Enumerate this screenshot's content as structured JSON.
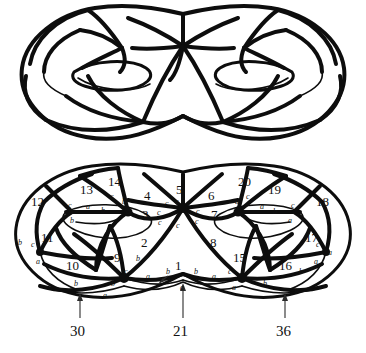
{
  "figure": {
    "top_panel": {
      "name": "double-torus-embedding",
      "description": "Double torus (genus 2 surface) with a graph drawn on it"
    },
    "bottom_panel": {
      "name": "planar-labelled-diagram",
      "description": "Planar projection of the double torus with numbered faces and lettered edges"
    }
  },
  "regions": [
    {
      "label": "1",
      "x": 179,
      "y": 266
    },
    {
      "label": "2",
      "x": 145,
      "y": 243
    },
    {
      "label": "3",
      "x": 146,
      "y": 215
    },
    {
      "label": "4",
      "x": 148,
      "y": 196
    },
    {
      "label": "5",
      "x": 180,
      "y": 190
    },
    {
      "label": "6",
      "x": 212,
      "y": 196
    },
    {
      "label": "7",
      "x": 215,
      "y": 215
    },
    {
      "label": "8",
      "x": 214,
      "y": 243
    },
    {
      "label": "9",
      "x": 118,
      "y": 258
    },
    {
      "label": "10",
      "x": 74,
      "y": 266
    },
    {
      "label": "11",
      "x": 49,
      "y": 238
    },
    {
      "label": "12",
      "x": 39,
      "y": 202
    },
    {
      "label": "13",
      "x": 88,
      "y": 190
    },
    {
      "label": "14",
      "x": 116,
      "y": 182
    },
    {
      "label": "15",
      "x": 241,
      "y": 258
    },
    {
      "label": "16",
      "x": 287,
      "y": 266
    },
    {
      "label": "17",
      "x": 313,
      "y": 238
    },
    {
      "label": "18",
      "x": 324,
      "y": 202
    },
    {
      "label": "19",
      "x": 276,
      "y": 190
    },
    {
      "label": "20",
      "x": 246,
      "y": 182
    }
  ],
  "edge_letters": [
    {
      "label": "c",
      "x": 177,
      "y": 202
    },
    {
      "label": "c",
      "x": 167,
      "y": 204
    },
    {
      "label": "c",
      "x": 189,
      "y": 204
    },
    {
      "label": "c",
      "x": 159,
      "y": 213
    },
    {
      "label": "c",
      "x": 198,
      "y": 212
    },
    {
      "label": "c",
      "x": 160,
      "y": 223
    },
    {
      "label": "c",
      "x": 197,
      "y": 222
    },
    {
      "label": "c",
      "x": 178,
      "y": 226
    },
    {
      "label": "c",
      "x": 112,
      "y": 197
    },
    {
      "label": "b",
      "x": 124,
      "y": 202
    },
    {
      "label": "b",
      "x": 103,
      "y": 211
    },
    {
      "label": "a",
      "x": 128,
      "y": 212
    },
    {
      "label": "a",
      "x": 88,
      "y": 207
    },
    {
      "label": "c",
      "x": 70,
      "y": 206
    },
    {
      "label": "b",
      "x": 72,
      "y": 221
    },
    {
      "label": "c",
      "x": 248,
      "y": 197
    },
    {
      "label": "a",
      "x": 237,
      "y": 202
    },
    {
      "label": "b",
      "x": 275,
      "y": 212
    },
    {
      "label": "a",
      "x": 248,
      "y": 212
    },
    {
      "label": "a",
      "x": 262,
      "y": 207
    },
    {
      "label": "c",
      "x": 293,
      "y": 206
    },
    {
      "label": "a",
      "x": 290,
      "y": 221
    },
    {
      "label": "b",
      "x": 20,
      "y": 243
    },
    {
      "label": "c",
      "x": 33,
      "y": 245
    },
    {
      "label": "a",
      "x": 38,
      "y": 262
    },
    {
      "label": "b",
      "x": 76,
      "y": 284
    },
    {
      "label": "a",
      "x": 105,
      "y": 296
    },
    {
      "label": "c",
      "x": 126,
      "y": 272
    },
    {
      "label": "b",
      "x": 138,
      "y": 259
    },
    {
      "label": "b",
      "x": 113,
      "y": 284
    },
    {
      "label": "a",
      "x": 148,
      "y": 277
    },
    {
      "label": "b",
      "x": 168,
      "y": 272
    },
    {
      "label": "b",
      "x": 196,
      "y": 272
    },
    {
      "label": "a",
      "x": 214,
      "y": 277
    },
    {
      "label": "c",
      "x": 230,
      "y": 272
    },
    {
      "label": "a",
      "x": 234,
      "y": 288
    },
    {
      "label": "a",
      "x": 182,
      "y": 288
    },
    {
      "label": "b",
      "x": 265,
      "y": 284
    },
    {
      "label": "a",
      "x": 316,
      "y": 262
    },
    {
      "label": "c",
      "x": 318,
      "y": 245
    },
    {
      "label": "b",
      "x": 301,
      "y": 272
    },
    {
      "label": "a",
      "x": 330,
      "y": 253
    },
    {
      "label": "a",
      "x": 297,
      "y": 290
    }
  ],
  "boundary_labels": [
    {
      "label": "30",
      "x": 80,
      "y": 332
    },
    {
      "label": "21",
      "x": 180,
      "y": 332
    },
    {
      "label": "36",
      "x": 285,
      "y": 332
    }
  ],
  "colors": {
    "ink": "#0d0d0d",
    "background": "#ffffff",
    "annotation": "#2b2b2b"
  }
}
